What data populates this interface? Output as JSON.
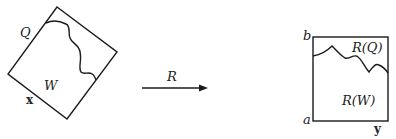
{
  "diagram": {
    "left_figure": {
      "region_upper_label": "Q",
      "region_lower_label": "W",
      "edge_label": "x"
    },
    "arrow": {
      "label": "R"
    },
    "right_figure": {
      "top_left_label": "b",
      "bottom_left_label": "a",
      "edge_label": "y",
      "region_upper_label": "R(Q)",
      "region_lower_label": "R(W)"
    }
  }
}
